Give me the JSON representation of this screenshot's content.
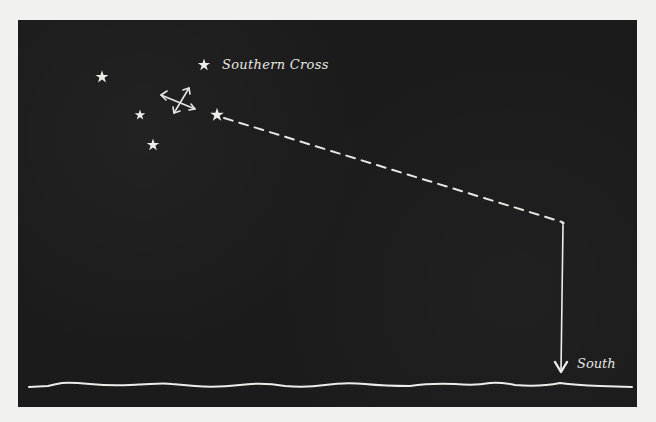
{
  "diagram": {
    "colors": {
      "background": "#f1f1ef",
      "sky": "#1b1b1b",
      "ink": "#e6e6e2"
    },
    "labels": {
      "constellation": "Southern Cross",
      "direction": "South"
    },
    "stars": [
      {
        "name": "pointer-star",
        "x": 102,
        "y": 77,
        "r": 6.5
      },
      {
        "name": "cross-top-star",
        "x": 204,
        "y": 65,
        "r": 6.5
      },
      {
        "name": "cross-left-star",
        "x": 140,
        "y": 115,
        "r": 5.5
      },
      {
        "name": "cross-right-star",
        "x": 217,
        "y": 115,
        "r": 7
      },
      {
        "name": "cross-bottom-star",
        "x": 153,
        "y": 145,
        "r": 6.5
      }
    ],
    "cross_center_symbol": "crossed-double-arrows",
    "projection_line": {
      "from": [
        222,
        117
      ],
      "to": [
        563,
        222
      ],
      "style": "dashed"
    },
    "south_arrow": {
      "from": [
        563,
        224
      ],
      "to": [
        561,
        373
      ]
    },
    "horizon": "wavy-line"
  }
}
